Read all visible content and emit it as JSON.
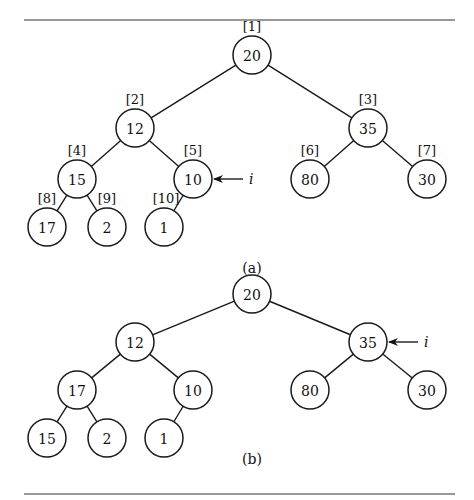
{
  "figure": {
    "rule_top_y": 20,
    "rule_bottom_y": 494,
    "node_radius": 19
  },
  "trees": [
    {
      "caption": "(a)",
      "caption_pos": [
        252,
        268
      ],
      "pointer": {
        "label": "i",
        "target_node": 4
      },
      "nodes": [
        {
          "value": "20",
          "index": "[1]",
          "x": 252,
          "y": 55
        },
        {
          "value": "12",
          "index": "[2]",
          "x": 135,
          "y": 128
        },
        {
          "value": "35",
          "index": "[3]",
          "x": 368,
          "y": 128
        },
        {
          "value": "15",
          "index": "[4]",
          "x": 77,
          "y": 179
        },
        {
          "value": "10",
          "index": "[5]",
          "x": 193,
          "y": 179
        },
        {
          "value": "80",
          "index": "[6]",
          "x": 310,
          "y": 179
        },
        {
          "value": "30",
          "index": "[7]",
          "x": 427,
          "y": 179
        },
        {
          "value": "17",
          "index": "[8]",
          "x": 47,
          "y": 227
        },
        {
          "value": "2",
          "index": "[9]",
          "x": 107,
          "y": 227
        },
        {
          "value": "1",
          "index": "[10]",
          "x": 164,
          "y": 227
        }
      ]
    },
    {
      "caption": "(b)",
      "caption_pos": [
        252,
        459
      ],
      "pointer": {
        "label": "i",
        "target_node": 2
      },
      "nodes": [
        {
          "value": "20",
          "index": "",
          "x": 252,
          "y": 294
        },
        {
          "value": "12",
          "index": "",
          "x": 135,
          "y": 342
        },
        {
          "value": "35",
          "index": "",
          "x": 368,
          "y": 342
        },
        {
          "value": "17",
          "index": "",
          "x": 77,
          "y": 390
        },
        {
          "value": "10",
          "index": "",
          "x": 193,
          "y": 390
        },
        {
          "value": "80",
          "index": "",
          "x": 310,
          "y": 390
        },
        {
          "value": "30",
          "index": "",
          "x": 427,
          "y": 390
        },
        {
          "value": "15",
          "index": "",
          "x": 47,
          "y": 438
        },
        {
          "value": "2",
          "index": "",
          "x": 107,
          "y": 438
        },
        {
          "value": "1",
          "index": "",
          "x": 164,
          "y": 438
        }
      ]
    }
  ]
}
